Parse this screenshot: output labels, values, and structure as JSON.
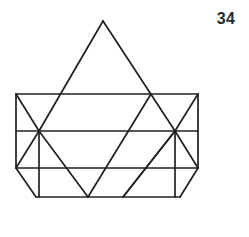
{
  "figure": {
    "number_label": "34",
    "caption": "",
    "stroke_color": "#231f20",
    "background_color": "#ffffff",
    "stroke_width": 1.7,
    "canvas": {
      "width": 249,
      "height": 237
    }
  },
  "geometry": {
    "points": {
      "apex": [
        103,
        21
      ],
      "top_left": [
        16,
        94
      ],
      "top_right": [
        198,
        94
      ],
      "tri_base_left": [
        55,
        94
      ],
      "tri_base_right": [
        151,
        94
      ],
      "mid_left": [
        16,
        131
      ],
      "mid_right": [
        198,
        131
      ],
      "node_left": [
        39,
        131
      ],
      "node_right": [
        175,
        131
      ],
      "low_left": [
        16,
        168
      ],
      "low_right": [
        198,
        168
      ],
      "bot_left": [
        36,
        197
      ],
      "bot_right": [
        180,
        197
      ],
      "tri_bottom": [
        88,
        197
      ],
      "diag_bottom": [
        123,
        197
      ]
    },
    "edges": [
      {
        "name": "triangle-left-leg",
        "path": [
          [
            103,
            21
          ],
          [
            39,
            131
          ]
        ]
      },
      {
        "name": "triangle-right-leg",
        "path": [
          [
            103,
            21
          ],
          [
            175,
            131
          ]
        ]
      },
      {
        "name": "rect-top-edge",
        "path": [
          [
            16,
            94
          ],
          [
            198,
            94
          ]
        ]
      },
      {
        "name": "rect-left-edge",
        "path": [
          [
            16,
            94
          ],
          [
            16,
            168
          ]
        ]
      },
      {
        "name": "rect-right-edge",
        "path": [
          [
            198,
            94
          ],
          [
            198,
            168
          ]
        ]
      },
      {
        "name": "mid-horizontal",
        "path": [
          [
            16,
            131
          ],
          [
            198,
            131
          ]
        ]
      },
      {
        "name": "low-horizontal",
        "path": [
          [
            16,
            168
          ],
          [
            198,
            168
          ]
        ]
      },
      {
        "name": "left-diag-down",
        "path": [
          [
            16,
            94
          ],
          [
            39,
            131
          ]
        ]
      },
      {
        "name": "left-diag-up",
        "path": [
          [
            39,
            131
          ],
          [
            16,
            168
          ]
        ]
      },
      {
        "name": "left-vertical-inner",
        "path": [
          [
            39,
            131
          ],
          [
            39,
            197
          ]
        ]
      },
      {
        "name": "right-diag-down",
        "path": [
          [
            198,
            94
          ],
          [
            175,
            131
          ]
        ]
      },
      {
        "name": "right-diag-up",
        "path": [
          [
            175,
            131
          ],
          [
            198,
            168
          ]
        ]
      },
      {
        "name": "right-vertical-inner",
        "path": [
          [
            175,
            131
          ],
          [
            175,
            197
          ]
        ]
      },
      {
        "name": "inner-left-descender",
        "path": [
          [
            39,
            131
          ],
          [
            88,
            197
          ]
        ]
      },
      {
        "name": "inner-right-descender",
        "path": [
          [
            175,
            131
          ],
          [
            123,
            197
          ]
        ]
      },
      {
        "name": "long-diag-upper",
        "path": [
          [
            151,
            94
          ],
          [
            88,
            197
          ]
        ]
      },
      {
        "name": "long-diag-lower",
        "path": [
          [
            175,
            131
          ],
          [
            123,
            197
          ]
        ]
      },
      {
        "name": "bottom-edge",
        "path": [
          [
            36,
            197
          ],
          [
            180,
            197
          ]
        ]
      },
      {
        "name": "bottom-left-slant",
        "path": [
          [
            16,
            168
          ],
          [
            36,
            197
          ]
        ]
      },
      {
        "name": "bottom-right-slant",
        "path": [
          [
            198,
            168
          ],
          [
            180,
            197
          ]
        ]
      }
    ]
  }
}
